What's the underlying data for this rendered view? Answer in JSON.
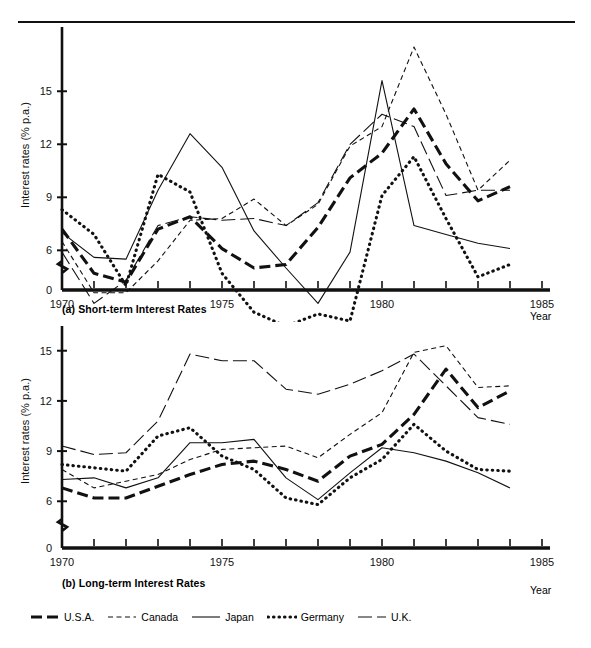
{
  "figure": {
    "year_axis_label": "Year",
    "y_axis_label": "Interest rates (% p.a.)",
    "caption_a": "(a) Short-term Interest Rates",
    "caption_b": "(b) Long-term Interest Rates"
  },
  "legend": {
    "items": [
      {
        "label": "U.S.A.",
        "key": "thick-dash-key",
        "style": "thick-dashed"
      },
      {
        "label": "Canada",
        "key": "fine-dash-key",
        "style": "fine-dashed"
      },
      {
        "label": "Japan",
        "key": "solid-key",
        "style": "thin-solid"
      },
      {
        "label": "Germany",
        "key": "dotted-key",
        "style": "dotted"
      },
      {
        "label": "U.K.",
        "key": "long-dash-key",
        "style": "long-dashed"
      }
    ]
  },
  "chart_data": [
    {
      "id": "short-term",
      "type": "line",
      "title": "(a) Short-term Interest Rates",
      "xlabel": "Year",
      "ylabel": "Interest rates (% p.a.)",
      "xlim": [
        1970,
        1985
      ],
      "ylim": [
        0,
        17.5
      ],
      "y_axis_break": true,
      "yticks": [
        0,
        6,
        9,
        12,
        15
      ],
      "xticks": [
        1970,
        1975,
        1980,
        1985
      ],
      "xtick_labels": [
        "1970",
        "1975",
        "1980",
        "1985"
      ],
      "grid": false,
      "legend_position": "below-figure",
      "x": [
        1970,
        1971,
        1972,
        1973,
        1974,
        1975,
        1976,
        1977,
        1978,
        1979,
        1980,
        1981,
        1982,
        1983,
        1984
      ],
      "series": [
        {
          "name": "U.S.A.",
          "values": [
            7.2,
            4.7,
            4.2,
            7.2,
            7.9,
            6.1,
            5.0,
            5.2,
            7.3,
            10.1,
            11.5,
            14.0,
            10.9,
            8.8,
            9.6
          ]
        },
        {
          "name": "Canada",
          "values": [
            6.5,
            3.6,
            3.6,
            5.4,
            7.7,
            7.8,
            8.9,
            7.4,
            8.6,
            11.9,
            13.0,
            17.5,
            13.7,
            9.4,
            11.1
          ]
        },
        {
          "name": "Japan",
          "values": [
            7.0,
            5.6,
            5.5,
            9.4,
            12.6,
            10.7,
            7.1,
            5.0,
            3.0,
            5.9,
            15.6,
            7.4,
            6.9,
            6.4,
            6.1
          ]
        },
        {
          "name": "Germany",
          "values": [
            8.3,
            6.9,
            4.0,
            10.3,
            9.3,
            4.7,
            2.5,
            1.7,
            2.4,
            2.0,
            9.1,
            11.3,
            7.8,
            4.5,
            5.2
          ]
        },
        {
          "name": "U.K.",
          "values": [
            5.9,
            3.0,
            4.3,
            7.4,
            7.9,
            7.7,
            7.8,
            7.4,
            8.7,
            12.0,
            13.7,
            13.0,
            9.1,
            9.4,
            9.4
          ]
        }
      ]
    },
    {
      "id": "long-term",
      "type": "line",
      "title": "(b) Long-term Interest Rates",
      "xlabel": "Year",
      "ylabel": "Interest rates (% p.a.)",
      "xlim": [
        1970,
        1985
      ],
      "ylim": [
        0,
        16.2
      ],
      "y_axis_break": true,
      "yticks": [
        0,
        6,
        9,
        12,
        15
      ],
      "xticks": [
        1970,
        1975,
        1980,
        1985
      ],
      "xtick_labels": [
        "1970",
        "1975",
        "1980",
        "1985"
      ],
      "grid": false,
      "legend_position": "below-figure",
      "x": [
        1970,
        1971,
        1972,
        1973,
        1974,
        1975,
        1976,
        1977,
        1978,
        1979,
        1980,
        1981,
        1982,
        1983,
        1984
      ],
      "series": [
        {
          "name": "U.S.A.",
          "values": [
            6.8,
            6.2,
            6.2,
            6.9,
            7.6,
            8.2,
            8.4,
            7.9,
            7.2,
            8.7,
            9.4,
            11.2,
            13.9,
            11.6,
            12.6
          ]
        },
        {
          "name": "Canada",
          "values": [
            7.9,
            6.8,
            7.2,
            7.6,
            8.5,
            9.1,
            9.2,
            9.3,
            8.6,
            10.0,
            11.3,
            14.9,
            15.3,
            12.8,
            12.9
          ]
        },
        {
          "name": "Japan",
          "values": [
            7.3,
            7.4,
            6.8,
            7.4,
            9.5,
            9.5,
            9.7,
            7.4,
            6.1,
            7.7,
            9.2,
            8.9,
            8.4,
            7.7,
            6.8
          ]
        },
        {
          "name": "Germany",
          "values": [
            8.2,
            8.0,
            7.8,
            9.9,
            10.4,
            8.7,
            7.9,
            6.2,
            5.8,
            7.4,
            8.5,
            10.6,
            9.0,
            7.9,
            7.8
          ]
        },
        {
          "name": "U.K.",
          "values": [
            9.3,
            8.8,
            8.9,
            10.8,
            14.8,
            14.4,
            14.4,
            12.7,
            12.4,
            13.0,
            13.8,
            14.8,
            12.9,
            11.0,
            10.6
          ]
        }
      ]
    }
  ]
}
